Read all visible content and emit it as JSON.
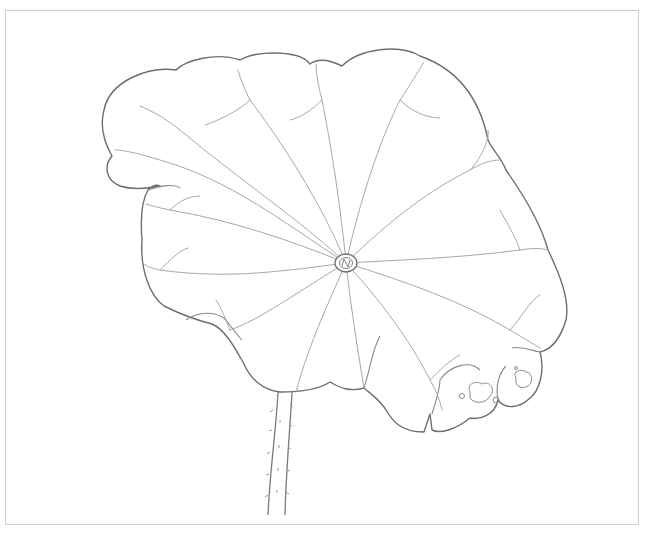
{
  "artwork": {
    "subject": "Lotus leaf pencil line drawing",
    "colors": {
      "background": "#ffffff",
      "frame": "#cfcfcf",
      "outline": "#6e6e6e",
      "vein": "#a8a8a8",
      "stem": "#7a7a7a"
    },
    "center": {
      "cx": 346,
      "cy": 263,
      "rx": 11,
      "ry": 9
    }
  }
}
